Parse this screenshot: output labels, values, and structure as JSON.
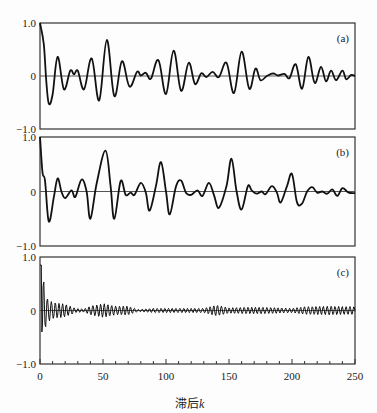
{
  "chart_data": [
    {
      "type": "line",
      "panel_label": "(a)",
      "xlim": [
        0,
        250
      ],
      "ylim": [
        -1.0,
        1.0
      ],
      "yticks": [
        "1.0",
        "0",
        "-1.0"
      ],
      "zero_line": true,
      "points": [
        [
          0,
          1.0
        ],
        [
          3,
          0.6
        ],
        [
          5,
          -0.1
        ],
        [
          7,
          -0.52
        ],
        [
          10,
          -0.35
        ],
        [
          14,
          0.36
        ],
        [
          19,
          -0.25
        ],
        [
          24,
          0.1
        ],
        [
          27,
          0.03
        ],
        [
          30,
          0.1
        ],
        [
          35,
          -0.25
        ],
        [
          41,
          0.33
        ],
        [
          47,
          -0.46
        ],
        [
          53,
          0.68
        ],
        [
          59,
          -0.38
        ],
        [
          65,
          0.28
        ],
        [
          71,
          -0.2
        ],
        [
          77,
          0.08
        ],
        [
          80,
          0.01
        ],
        [
          84,
          0.06
        ],
        [
          88,
          -0.05
        ],
        [
          94,
          0.3
        ],
        [
          100,
          -0.34
        ],
        [
          106,
          0.48
        ],
        [
          112,
          -0.28
        ],
        [
          118,
          0.25
        ],
        [
          123,
          -0.15
        ],
        [
          128,
          0.05
        ],
        [
          132,
          -0.02
        ],
        [
          137,
          0.08
        ],
        [
          142,
          -0.02
        ],
        [
          148,
          0.25
        ],
        [
          154,
          -0.32
        ],
        [
          160,
          0.46
        ],
        [
          166,
          -0.24
        ],
        [
          171,
          0.14
        ],
        [
          175,
          -0.08
        ],
        [
          180,
          0.0
        ],
        [
          185,
          0.05
        ],
        [
          189,
          0.01
        ],
        [
          194,
          0.04
        ],
        [
          198,
          -0.04
        ],
        [
          203,
          0.22
        ],
        [
          208,
          -0.24
        ],
        [
          213,
          0.36
        ],
        [
          218,
          -0.13
        ],
        [
          223,
          0.17
        ],
        [
          227,
          -0.1
        ],
        [
          231,
          0.1
        ],
        [
          235,
          -0.08
        ],
        [
          240,
          0.1
        ],
        [
          243,
          -0.06
        ],
        [
          247,
          0.02
        ],
        [
          250,
          0.0
        ]
      ]
    },
    {
      "type": "line",
      "panel_label": "(b)",
      "xlim": [
        0,
        250
      ],
      "ylim": [
        -1.0,
        1.0
      ],
      "yticks": [
        "1.0",
        "0",
        "-1.0"
      ],
      "zero_line": true,
      "points": [
        [
          0,
          1.0
        ],
        [
          2,
          0.35
        ],
        [
          4,
          0.2
        ],
        [
          7,
          -0.55
        ],
        [
          11,
          -0.1
        ],
        [
          14,
          0.24
        ],
        [
          17,
          0.0
        ],
        [
          20,
          -0.12
        ],
        [
          25,
          0.02
        ],
        [
          28,
          -0.1
        ],
        [
          33,
          0.22
        ],
        [
          37,
          0.0
        ],
        [
          40,
          -0.5
        ],
        [
          45,
          0.15
        ],
        [
          52,
          0.75
        ],
        [
          56,
          0.1
        ],
        [
          59,
          -0.5
        ],
        [
          64,
          0.19
        ],
        [
          68,
          -0.06
        ],
        [
          72,
          -0.02
        ],
        [
          75,
          -0.06
        ],
        [
          80,
          0.16
        ],
        [
          84,
          -0.02
        ],
        [
          87,
          -0.35
        ],
        [
          92,
          0.1
        ],
        [
          96,
          0.54
        ],
        [
          100,
          0.0
        ],
        [
          103,
          -0.42
        ],
        [
          108,
          0.1
        ],
        [
          112,
          0.2
        ],
        [
          116,
          -0.03
        ],
        [
          120,
          -0.06
        ],
        [
          125,
          0.02
        ],
        [
          129,
          -0.08
        ],
        [
          134,
          0.16
        ],
        [
          138,
          -0.06
        ],
        [
          142,
          -0.3
        ],
        [
          148,
          0.1
        ],
        [
          152,
          0.6
        ],
        [
          156,
          0.0
        ],
        [
          160,
          -0.33
        ],
        [
          165,
          0.1
        ],
        [
          168,
          0.02
        ],
        [
          172,
          -0.04
        ],
        [
          176,
          0.0
        ],
        [
          179,
          -0.05
        ],
        [
          184,
          0.1
        ],
        [
          188,
          -0.02
        ],
        [
          191,
          -0.2
        ],
        [
          196,
          0.1
        ],
        [
          200,
          0.32
        ],
        [
          204,
          -0.2
        ],
        [
          208,
          -0.22
        ],
        [
          212,
          0.0
        ],
        [
          216,
          0.08
        ],
        [
          220,
          -0.02
        ],
        [
          224,
          0.0
        ],
        [
          228,
          -0.04
        ],
        [
          232,
          0.04
        ],
        [
          236,
          -0.08
        ],
        [
          240,
          0.06
        ],
        [
          245,
          -0.02
        ],
        [
          250,
          -0.03
        ]
      ]
    },
    {
      "type": "line",
      "panel_label": "(c)",
      "xlim": [
        0,
        250
      ],
      "ylim": [
        -1.0,
        1.0
      ],
      "yticks": [
        "1.0",
        "0",
        "-1.0"
      ],
      "zero_line": true,
      "description": "rapidly oscillating autocorrelation: spike ~0.85 at lag 1, decays quickly; small bursts (~±0.1) around lags 40-70, 140, 200-250",
      "envelope": [
        [
          0,
          0.85
        ],
        [
          2,
          0.75
        ],
        [
          4,
          0.35
        ],
        [
          6,
          0.22
        ],
        [
          10,
          0.15
        ],
        [
          20,
          0.12
        ],
        [
          28,
          0.04
        ],
        [
          35,
          0.03
        ],
        [
          40,
          0.08
        ],
        [
          50,
          0.13
        ],
        [
          60,
          0.08
        ],
        [
          70,
          0.08
        ],
        [
          78,
          0.02
        ],
        [
          90,
          0.04
        ],
        [
          110,
          0.04
        ],
        [
          130,
          0.04
        ],
        [
          140,
          0.1
        ],
        [
          150,
          0.05
        ],
        [
          165,
          0.06
        ],
        [
          175,
          0.06
        ],
        [
          190,
          0.05
        ],
        [
          200,
          0.04
        ],
        [
          210,
          0.07
        ],
        [
          230,
          0.08
        ],
        [
          250,
          0.07
        ]
      ],
      "period": 3
    }
  ],
  "axes": {
    "xticks": [
      "0",
      "50",
      "100",
      "150",
      "200",
      "250"
    ],
    "xtick_values": [
      0,
      50,
      100,
      150,
      200,
      250
    ],
    "xlabel_prefix": "滞后",
    "xlabel_var": "k"
  }
}
